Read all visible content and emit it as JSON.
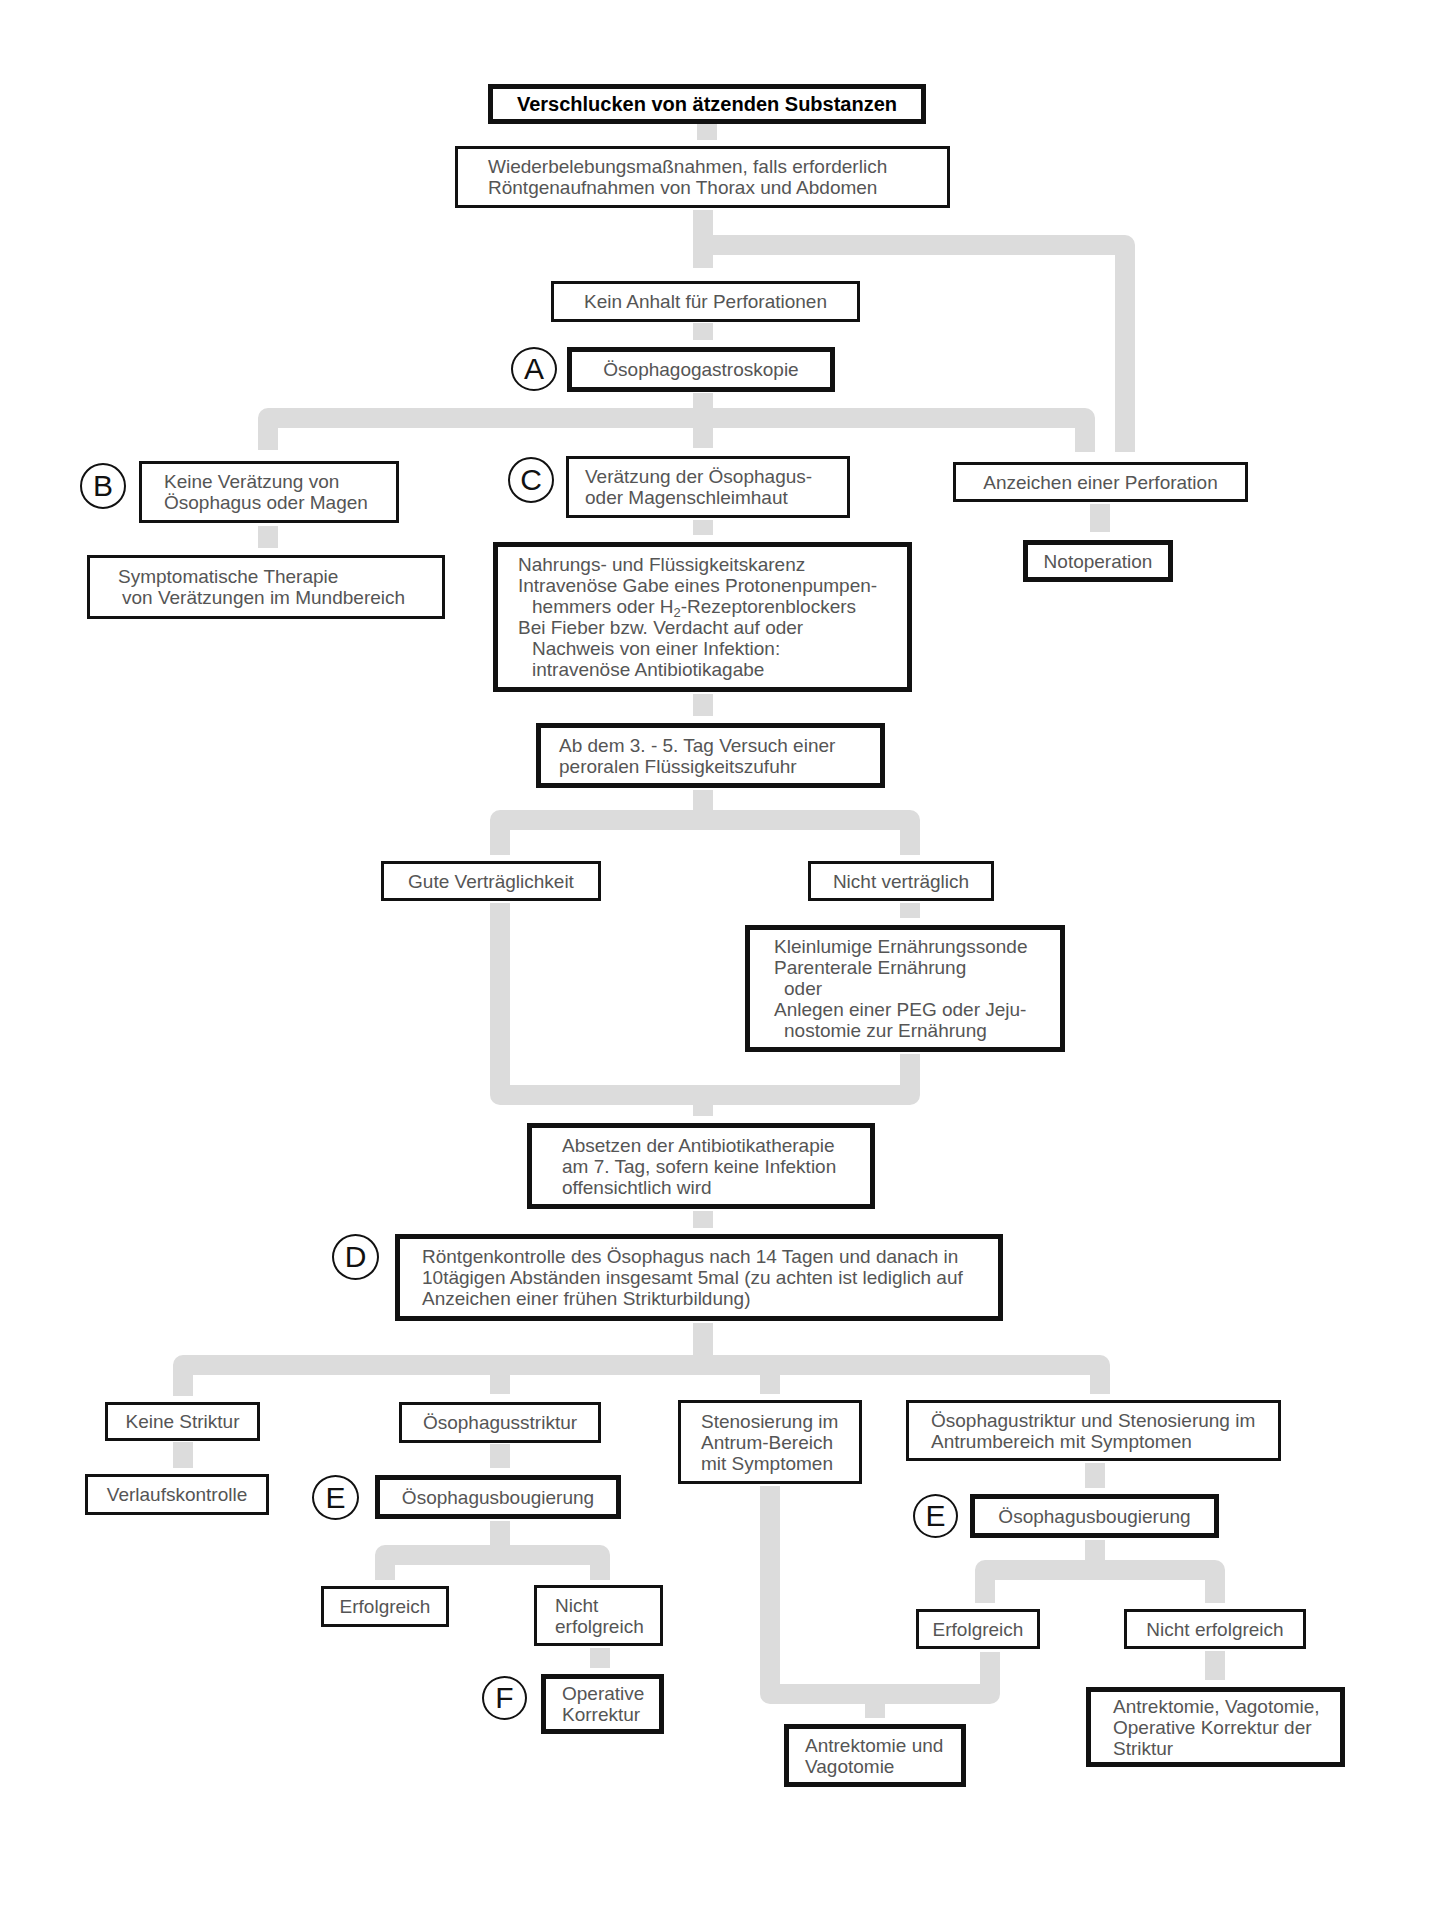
{
  "diagram": {
    "title": "Verschlucken von ätzenden Substanzen",
    "connector_color": "#dcdcdc",
    "border_color": "#111111",
    "text_color": "#555555",
    "nodes": {
      "resuscitation": {
        "lines": [
          "Wiederbelebungsmaßnahmen, falls erforderlich",
          "Röntgenaufnahmen von Thorax und Abdomen"
        ]
      },
      "no_perforation": {
        "text": "Kein Anhalt für Perforationen"
      },
      "endoscopy": {
        "marker": "A",
        "text": "Ösophagogastroskopie"
      },
      "no_burn": {
        "marker": "B",
        "lines": [
          "Keine Verätzung von",
          "Ösophagus oder Magen"
        ]
      },
      "symptomatic": {
        "lines": [
          "Symptomatische Therapie",
          "von Verätzungen im Mundbereich"
        ]
      },
      "burn": {
        "marker": "C",
        "lines": [
          "Verätzung der Ösophagus-",
          "oder Magenschleimhaut"
        ]
      },
      "fasting": {
        "lines": [
          "Nahrungs- und Flüssigkeitskarenz",
          "Intravenöse Gabe eines Protonenpumpen-",
          "hemmers oder H",
          "2",
          "-Rezeptorenblockers",
          "Bei Fieber bzw. Verdacht auf oder",
          "Nachweis von einer Infektion:",
          "intravenöse Antibiotikagabe"
        ]
      },
      "perforation_signs": {
        "text": "Anzeichen einer Perforation"
      },
      "emergency_op": {
        "text": "Notoperation"
      },
      "oral_trial": {
        "lines": [
          "Ab dem 3. - 5. Tag Versuch einer",
          "peroralen Flüssigkeitszufuhr"
        ]
      },
      "tolerated": {
        "text": "Gute Verträglichkeit"
      },
      "not_tolerated": {
        "text": "Nicht verträglich"
      },
      "nutrition": {
        "lines": [
          "Kleinlumige Ernährungssonde",
          "Parenterale Ernährung",
          "oder",
          "Anlegen einer PEG oder Jeju-",
          "nostomie zur Ernährung"
        ]
      },
      "stop_antibiotics": {
        "lines": [
          "Absetzen der Antibiotikatherapie",
          "am 7. Tag, sofern keine Infektion",
          "offensichtlich wird"
        ]
      },
      "xray_control": {
        "marker": "D",
        "lines": [
          "Röntgenkontrolle des Ösophagus nach 14 Tagen und danach in",
          "10tägigen Abständen insgesamt 5mal (zu achten ist lediglich auf",
          "Anzeichen einer frühen Strikturbildung)"
        ]
      },
      "no_stricture": {
        "text": "Keine Striktur"
      },
      "follow_up": {
        "text": "Verlaufskontrolle"
      },
      "esophageal_stricture": {
        "text": "Ösophagusstriktur"
      },
      "bougienage_1": {
        "marker": "E",
        "text": "Ösophagusbougierung"
      },
      "success_1": {
        "text": "Erfolgreich"
      },
      "fail_1": {
        "lines": [
          "Nicht",
          "erfolgreich"
        ]
      },
      "surgical_1": {
        "marker": "F",
        "lines": [
          "Operative",
          "Korrektur"
        ]
      },
      "antrum_stenosis": {
        "lines": [
          "Stenosierung im",
          "Antrum-Bereich",
          "mit Symptomen"
        ]
      },
      "combined": {
        "lines": [
          "Ösophagustriktur und Stenosierung im",
          "Antrumbereich mit Symptomen"
        ]
      },
      "bougienage_2": {
        "marker": "E",
        "text": "Ösophagusbougierung"
      },
      "success_2": {
        "text": "Erfolgreich"
      },
      "fail_2": {
        "text": "Nicht erfolgreich"
      },
      "antrectomy": {
        "lines": [
          "Antrektomie und",
          "Vagotomie"
        ]
      },
      "antrectomy_full": {
        "lines": [
          "Antrektomie, Vagotomie,",
          "Operative Korrektur der",
          "Striktur"
        ]
      }
    }
  }
}
